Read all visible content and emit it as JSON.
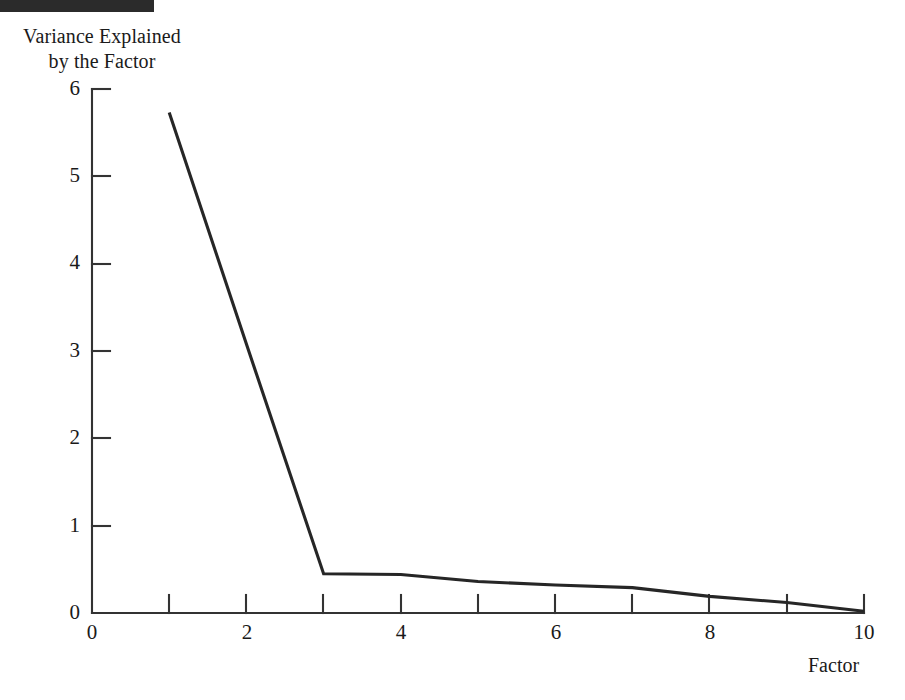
{
  "figure": {
    "marker_bar": "black-bar",
    "y_axis_caption_line1": "Variance Explained",
    "y_axis_caption_line2": "by the Factor",
    "x_axis_caption": "Factor"
  },
  "chart_data": {
    "type": "line",
    "title": "",
    "subtitle": "",
    "xlabel": "Factor",
    "ylabel": "Variance Explained by the Factor",
    "x": [
      1,
      2,
      3,
      4,
      5,
      6,
      7,
      8,
      9,
      10
    ],
    "values": [
      5.73,
      3.08,
      0.45,
      0.44,
      0.36,
      0.32,
      0.29,
      0.19,
      0.12,
      0.02
    ],
    "series": [
      {
        "name": "Variance Explained",
        "values": [
          5.73,
          3.08,
          0.45,
          0.44,
          0.36,
          0.32,
          0.29,
          0.19,
          0.12,
          0.02
        ]
      }
    ],
    "xlim": [
      0,
      10
    ],
    "ylim": [
      0,
      6
    ],
    "x_ticks": [
      0,
      1,
      2,
      3,
      4,
      5,
      6,
      7,
      8,
      9,
      10
    ],
    "x_tick_labels": [
      "0",
      "",
      "2",
      "",
      "4",
      "",
      "6",
      "",
      "8",
      "",
      "10"
    ],
    "y_ticks": [
      0,
      1,
      2,
      3,
      4,
      5,
      6
    ],
    "y_tick_labels": [
      "0",
      "1",
      "2",
      "3",
      "4",
      "5",
      "6"
    ],
    "grid": false,
    "legend": "none",
    "line_color": "#262626",
    "axis_color": "#333333",
    "background": "#ffffff"
  },
  "y_tick_labels": [
    {
      "text": "6",
      "top": 78
    },
    {
      "text": "5",
      "top": 165
    },
    {
      "text": "4",
      "top": 252
    },
    {
      "text": "3",
      "top": 340
    },
    {
      "text": "2",
      "top": 427
    },
    {
      "text": "1",
      "top": 515
    },
    {
      "text": "0",
      "top": 602
    }
  ],
  "x_tick_labels": [
    {
      "text": "0",
      "left": 70
    },
    {
      "text": "2",
      "left": 225
    },
    {
      "text": "4",
      "left": 379
    },
    {
      "text": "6",
      "left": 534
    },
    {
      "text": "8",
      "left": 688
    },
    {
      "text": "10",
      "left": 842
    }
  ]
}
